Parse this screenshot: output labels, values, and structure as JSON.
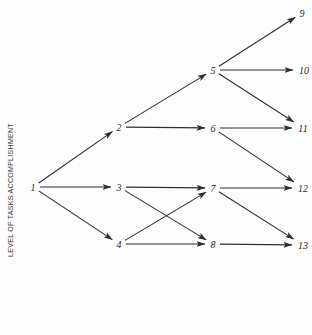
{
  "axis": {
    "ylabel": "LEVEL OF TASKS ACCOMPLISHMENT"
  },
  "colors": {
    "line": "#2e2e2e",
    "text": "#2a2a2a",
    "background": "#fdfdfd"
  },
  "nodes": [
    {
      "id": "1",
      "label": "1",
      "x": 33,
      "y": 187
    },
    {
      "id": "2",
      "label": "2",
      "x": 119,
      "y": 127
    },
    {
      "id": "3",
      "label": "3",
      "x": 119,
      "y": 187
    },
    {
      "id": "4",
      "label": "4",
      "x": 119,
      "y": 244
    },
    {
      "id": "5",
      "label": "5",
      "x": 213,
      "y": 70
    },
    {
      "id": "6",
      "label": "6",
      "x": 213,
      "y": 128
    },
    {
      "id": "7",
      "label": "7",
      "x": 213,
      "y": 188
    },
    {
      "id": "8",
      "label": "8",
      "x": 213,
      "y": 244
    },
    {
      "id": "9",
      "label": "9",
      "x": 302,
      "y": 13
    },
    {
      "id": "10",
      "label": "10",
      "x": 304,
      "y": 70
    },
    {
      "id": "11",
      "label": "11",
      "x": 303,
      "y": 128
    },
    {
      "id": "12",
      "label": "12",
      "x": 303,
      "y": 188
    },
    {
      "id": "13",
      "label": "13",
      "x": 303,
      "y": 245
    }
  ],
  "edges": [
    {
      "from": "1",
      "to": "2"
    },
    {
      "from": "1",
      "to": "3"
    },
    {
      "from": "1",
      "to": "4"
    },
    {
      "from": "2",
      "to": "5"
    },
    {
      "from": "2",
      "to": "6"
    },
    {
      "from": "3",
      "to": "7"
    },
    {
      "from": "3",
      "to": "8"
    },
    {
      "from": "4",
      "to": "7"
    },
    {
      "from": "4",
      "to": "8"
    },
    {
      "from": "5",
      "to": "9"
    },
    {
      "from": "5",
      "to": "10"
    },
    {
      "from": "5",
      "to": "11"
    },
    {
      "from": "6",
      "to": "11"
    },
    {
      "from": "6",
      "to": "12"
    },
    {
      "from": "7",
      "to": "12"
    },
    {
      "from": "7",
      "to": "13"
    },
    {
      "from": "8",
      "to": "13"
    }
  ]
}
